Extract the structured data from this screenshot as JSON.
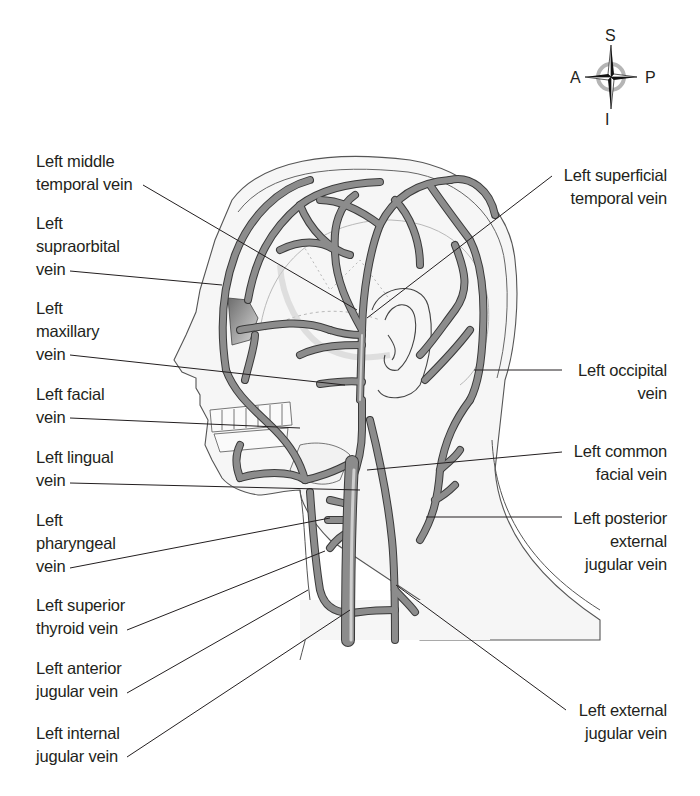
{
  "figure": {
    "colors": {
      "vein_fill": "#8a8a8a",
      "vein_highlight": "#c8c8c8",
      "vein_outline": "#3a3a3a",
      "skin_outline": "#555555",
      "skin_fill": "#f4f4f4",
      "skull_line": "#b8b8b8",
      "leader_line": "#231f20",
      "text": "#231f20",
      "compass_ring": "#b5b5b5"
    }
  },
  "compass": {
    "superior": "S",
    "inferior": "I",
    "anterior": "A",
    "posterior": "P"
  },
  "labels_left": [
    {
      "id": "middle-temporal",
      "lines": [
        "Left middle",
        "temporal vein"
      ]
    },
    {
      "id": "supraorbital",
      "lines": [
        "Left",
        "supraorbital",
        "vein"
      ]
    },
    {
      "id": "maxillary",
      "lines": [
        "Left",
        "maxillary",
        "vein"
      ]
    },
    {
      "id": "facial",
      "lines": [
        "Left facial",
        "vein"
      ]
    },
    {
      "id": "lingual",
      "lines": [
        "Left lingual",
        "vein"
      ]
    },
    {
      "id": "pharyngeal",
      "lines": [
        "Left",
        "pharyngeal",
        "vein"
      ]
    },
    {
      "id": "superior-thyroid",
      "lines": [
        "Left superior",
        "thyroid vein"
      ]
    },
    {
      "id": "anterior-jugular",
      "lines": [
        "Left anterior",
        "jugular vein"
      ]
    },
    {
      "id": "internal-jugular",
      "lines": [
        "Left internal",
        "jugular vein"
      ]
    }
  ],
  "labels_right": [
    {
      "id": "superficial-temporal",
      "lines": [
        "Left superficial",
        "temporal vein"
      ]
    },
    {
      "id": "occipital",
      "lines": [
        "Left occipital",
        "vein"
      ]
    },
    {
      "id": "common-facial",
      "lines": [
        "Left common",
        "facial vein"
      ]
    },
    {
      "id": "posterior-external-jugular",
      "lines": [
        "Left posterior",
        "external",
        "jugular vein"
      ]
    },
    {
      "id": "external-jugular",
      "lines": [
        "Left external",
        "jugular vein"
      ]
    }
  ]
}
